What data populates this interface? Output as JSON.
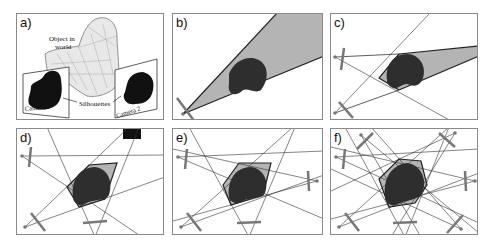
{
  "figure": {
    "panels": [
      {
        "id": "a",
        "label": "a)"
      },
      {
        "id": "b",
        "label": "b)"
      },
      {
        "id": "c",
        "label": "c)"
      },
      {
        "id": "d",
        "label": "d)"
      },
      {
        "id": "e",
        "label": "e)"
      },
      {
        "id": "f",
        "label": "f)"
      }
    ],
    "panel_a": {
      "object_label_line1": "Object in",
      "object_label_line2": "world",
      "silhouettes_label": "Silhouettes",
      "camera1_label": "Camera 1",
      "camera2_label": "Camera 2"
    },
    "colors": {
      "cone_fill": "#b4b4b4",
      "object_fill": "#2e2e2e",
      "camera_bar": "#777777",
      "line": "#333333"
    }
  }
}
